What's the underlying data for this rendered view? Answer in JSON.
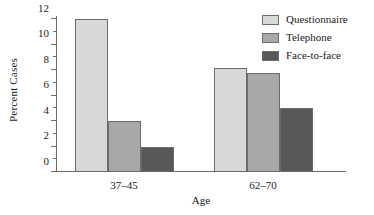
{
  "chart_data": {
    "type": "bar",
    "title": "",
    "xlabel": "Age",
    "ylabel": "Percent Cases",
    "categories": [
      "37–45",
      "62–70"
    ],
    "series": [
      {
        "name": "Questionnaire",
        "values": [
          12.0,
          8.15
        ],
        "color": "#d8d8d6"
      },
      {
        "name": "Telephone",
        "values": [
          4.0,
          7.75
        ],
        "color": "#a8a8a6"
      },
      {
        "name": "Face-to-face",
        "values": [
          2.0,
          5.0
        ],
        "color": "#585856"
      }
    ],
    "ylim": [
      0,
      12
    ],
    "y_major_ticks": [
      0,
      2,
      4,
      6,
      8,
      10,
      12
    ],
    "y_tick_labels": [
      "0",
      "2",
      "4",
      "6",
      "8",
      "10",
      "12"
    ],
    "y_minor_ticks": [
      1,
      3,
      5,
      7,
      9,
      11
    ],
    "grid": false,
    "legend_position": "top-right",
    "axis_color": "#6e6e6e",
    "bar_outline_color": "#6b6b6b",
    "background": "#ffffff"
  },
  "legend": {
    "items": [
      {
        "label": "Questionnaire"
      },
      {
        "label": "Telephone"
      },
      {
        "label": "Face-to-face"
      }
    ]
  }
}
